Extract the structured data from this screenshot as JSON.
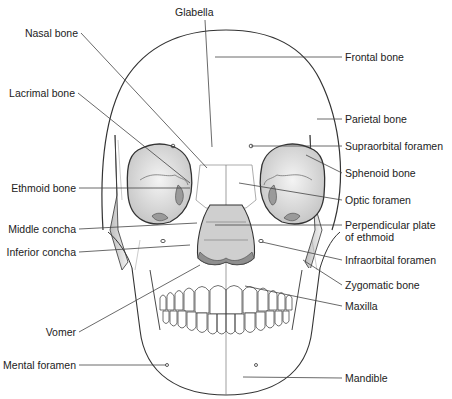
{
  "diagram": {
    "colors": {
      "line": "#333333",
      "bone_fill": "#ffffff",
      "orbit_fill": "#d8d8d8",
      "shade": "#a8a8a8",
      "leader": "#444444",
      "text": "#222222"
    },
    "labels_left": [
      {
        "id": "nasal-bone",
        "text": "Nasal bone",
        "x": 81,
        "y": 33,
        "tx": 207,
        "ty": 168
      },
      {
        "id": "lacrimal-bone",
        "text": "Lacrimal bone",
        "x": 78,
        "y": 93,
        "tx": 190,
        "ty": 183
      },
      {
        "id": "ethmoid-bone",
        "text": "Ethmoid bone",
        "x": 79,
        "y": 188,
        "tx": 190,
        "ty": 188
      },
      {
        "id": "middle-concha",
        "text": "Middle concha",
        "x": 79,
        "y": 229,
        "tx": 197,
        "ty": 223
      },
      {
        "id": "inferior-concha",
        "text": "Inferior concha",
        "x": 79,
        "y": 252,
        "tx": 190,
        "ty": 245
      },
      {
        "id": "vomer",
        "text": "Vomer",
        "x": 79,
        "y": 332,
        "tx": 200,
        "ty": 265
      },
      {
        "id": "mental-foramen",
        "text": "Mental foramen",
        "x": 79,
        "y": 365,
        "tx": 166,
        "ty": 365
      }
    ],
    "labels_right": [
      {
        "id": "frontal-bone",
        "text": "Frontal bone",
        "x": 342,
        "y": 57,
        "tx": 215,
        "ty": 57
      },
      {
        "id": "parietal-bone",
        "text": "Parietal bone",
        "x": 342,
        "y": 119,
        "tx": 317,
        "ty": 119
      },
      {
        "id": "supraorbital-foramen",
        "text": "Supraorbital foramen",
        "x": 342,
        "y": 146,
        "tx": 251,
        "ty": 146
      },
      {
        "id": "sphenoid-bone",
        "text": "Sphenoid bone",
        "x": 342,
        "y": 173,
        "tx": 306,
        "ty": 155
      },
      {
        "id": "optic-foramen",
        "text": "Optic foramen",
        "x": 342,
        "y": 200,
        "tx": 239,
        "ty": 183
      },
      {
        "id": "perpendicular-plate",
        "text": "Perpendicular plate",
        "text2": "of ethmoid",
        "x": 342,
        "y": 225,
        "tx": 215,
        "ty": 225
      },
      {
        "id": "infraorbital-foramen",
        "text": "Infraorbital foramen",
        "x": 342,
        "y": 260,
        "tx": 262,
        "ty": 242
      },
      {
        "id": "zygomatic-bone",
        "text": "Zygomatic bone",
        "x": 342,
        "y": 285,
        "tx": 303,
        "ty": 260
      },
      {
        "id": "maxilla",
        "text": "Maxilla",
        "x": 342,
        "y": 306,
        "tx": 245,
        "ty": 286
      },
      {
        "id": "mandible",
        "text": "Mandible",
        "x": 342,
        "y": 378,
        "tx": 243,
        "ty": 377
      }
    ],
    "labels_top": [
      {
        "id": "glabella",
        "text": "Glabella",
        "x": 175,
        "y": 12,
        "tx": 212,
        "ty": 147
      }
    ]
  }
}
